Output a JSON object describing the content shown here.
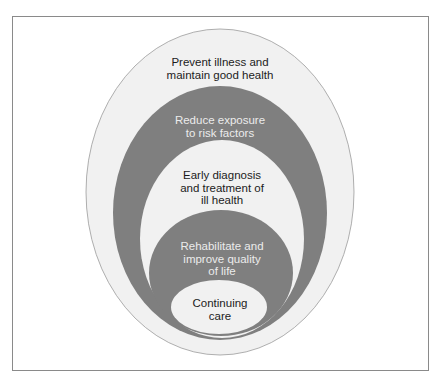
{
  "diagram": {
    "type": "nested-ellipses",
    "colors": {
      "light_fill": "#f1f1f1",
      "dark_fill": "#7f7f7f",
      "outline": "#9a9a9a",
      "frame": "#8a8a8a",
      "dark_text": "#1c1c1c",
      "light_text": "#ececec"
    },
    "levels": [
      {
        "label": "Prevent illness and\nmaintain good health",
        "fill": "light"
      },
      {
        "label": "Reduce exposure\nto risk factors",
        "fill": "dark"
      },
      {
        "label": "Early diagnosis\nand treatment of\nill health",
        "fill": "light"
      },
      {
        "label": "Rehabilitate and\nimprove quality\nof life",
        "fill": "dark"
      },
      {
        "label": "Continuing\ncare",
        "fill": "light"
      }
    ]
  }
}
